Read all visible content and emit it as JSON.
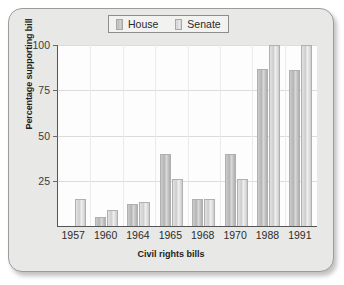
{
  "chart_data": {
    "type": "bar",
    "title": "",
    "xlabel": "Civil rights bills",
    "ylabel": "Percentage supporting bill",
    "categories": [
      "1957",
      "1960",
      "1964",
      "1965",
      "1968",
      "1970",
      "1988",
      "1991"
    ],
    "series": [
      {
        "name": "House",
        "values": [
          null,
          5,
          12,
          40,
          15,
          40,
          87,
          86
        ]
      },
      {
        "name": "Senate",
        "values": [
          15,
          9,
          13,
          26,
          15,
          26,
          100,
          100
        ]
      }
    ],
    "ylim": [
      0,
      100
    ],
    "yticks": [
      25,
      50,
      75,
      100
    ],
    "ytick_labels": [
      "25",
      "50",
      "75",
      "100"
    ],
    "grid": true,
    "legend_position": "top-center",
    "colors": {
      "house": "#bdbdbd",
      "senate": "#dcdcdc",
      "plot_background": "#fdfdfd",
      "figure_background": "#e8e8e6",
      "axis": "#555555",
      "gridline": "#dcdcdc"
    }
  },
  "legend": {
    "entries": [
      {
        "label": "House",
        "swatch": "house-swatch-icon"
      },
      {
        "label": "Senate",
        "swatch": "senate-swatch-icon"
      }
    ]
  }
}
